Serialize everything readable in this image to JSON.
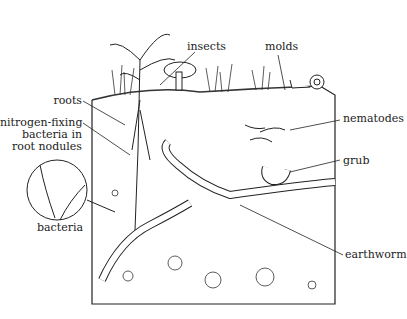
{
  "labels": {
    "insects": "insects",
    "molds": "molds",
    "roots": "roots",
    "nitrogen_line1": "nitrogen-fixing",
    "nitrogen_line2": "bacteria in",
    "nitrogen_line3": "root nodules",
    "nematodes": "nematodes",
    "grub": "grub",
    "bacteria": "bacteria",
    "earthworm": "earthworm"
  }
}
